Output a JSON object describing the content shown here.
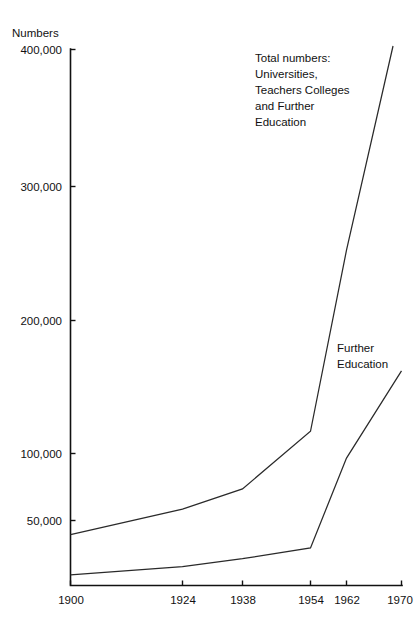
{
  "chart_data": {
    "type": "line",
    "title": "",
    "subtitle": "",
    "ylabel": "Numbers",
    "xlabel": "",
    "grid": false,
    "legend_position": "inline-annotation",
    "x_axis_note": "non-linear / uneven tick spacing",
    "categories": [
      "1900",
      "1924",
      "1938",
      "1954",
      "1962",
      "1970"
    ],
    "xtick_labels": [
      "1900",
      "1924",
      "1938",
      "1954",
      "1962",
      "1970"
    ],
    "ytick_labels": [
      "50,000",
      "100,000",
      "200,000",
      "300,000",
      "400,000"
    ],
    "ytick_values": [
      50000,
      100000,
      200000,
      300000,
      400000
    ],
    "ylim": [
      0,
      400000
    ],
    "series": [
      {
        "name": "Total numbers: Universities, Teachers Colleges and Further Education",
        "short_name": "Total numbers",
        "x": [
          "1900",
          "1924",
          "1938",
          "1954",
          "1962",
          "1970"
        ],
        "values": [
          38000,
          57000,
          72000,
          115000,
          250000,
          430000
        ]
      },
      {
        "name": "Further Education",
        "short_name": "Further Education",
        "x": [
          "1900",
          "1924",
          "1938",
          "1954",
          "1962",
          "1970"
        ],
        "values": [
          8000,
          14000,
          20000,
          28000,
          95000,
          160000
        ]
      }
    ],
    "annotations": [
      {
        "id": "total-numbers",
        "lines": [
          "Total numbers:",
          "Universities,",
          "Teachers Colleges",
          "and Further",
          "Education"
        ]
      },
      {
        "id": "further-education",
        "lines": [
          "Further",
          "Education"
        ]
      }
    ],
    "colors": {
      "line": "#2a2a2a",
      "axis": "#111111",
      "text": "#111111",
      "background": "#ffffff"
    }
  },
  "axis": {
    "y_title": "Numbers",
    "yticks": [
      {
        "label": "400,000"
      },
      {
        "label": "300,000"
      },
      {
        "label": "200,000"
      },
      {
        "label": "100,000"
      },
      {
        "label": "50,000"
      }
    ],
    "xticks": [
      {
        "label": "1900"
      },
      {
        "label": "1924"
      },
      {
        "label": "1938"
      },
      {
        "label": "1954"
      },
      {
        "label": "1962"
      },
      {
        "label": "1970"
      }
    ]
  },
  "annotation_total": {
    "line1": "Total numbers:",
    "line2": "Universities,",
    "line3": "Teachers Colleges",
    "line4": "and Further",
    "line5": "Education"
  },
  "annotation_further": {
    "line1": "Further",
    "line2": "Education"
  }
}
